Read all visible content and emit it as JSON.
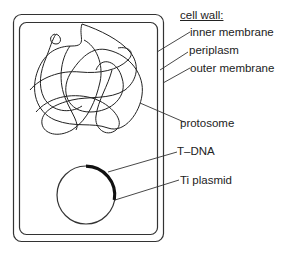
{
  "diagram": {
    "labels": {
      "cell_wall": "cell wall:",
      "inner_membrane": "inner membrane",
      "periplasm": "periplasm",
      "outer_membrane": "outer membrane",
      "protosome": "protosome",
      "t_dna": "T–DNA",
      "ti_plasmid": "Ti plasmid"
    },
    "colors": {
      "line": "#222222",
      "background": "#ffffff"
    }
  }
}
